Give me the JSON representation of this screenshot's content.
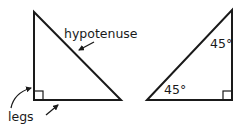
{
  "diagram": {
    "stroke_color": "#1a1a1a",
    "left_triangle": {
      "hypotenuse_label": "hypotenuse",
      "legs_label": "legs"
    },
    "right_triangle": {
      "angle_top_label": "45°",
      "angle_bottom_label": "45°"
    }
  }
}
